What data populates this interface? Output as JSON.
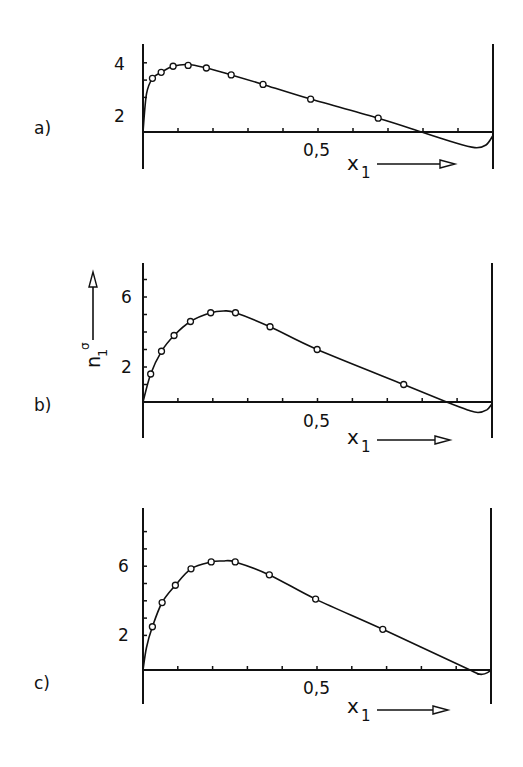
{
  "chart_data": [
    {
      "panel": "a)",
      "type": "line",
      "xlabel": "x1",
      "ylabel": "n1^σ",
      "x_tick_label": "0,5",
      "y_tick_labels": [
        "2",
        "4"
      ],
      "xlim": [
        0,
        1
      ],
      "ylim": [
        -1.5,
        5
      ],
      "x_minor_ticks": [
        0.1,
        0.2,
        0.3,
        0.4,
        0.5,
        0.6,
        0.7,
        0.8,
        0.9
      ],
      "y_minor_ticks": [
        2,
        3,
        4
      ],
      "grid": false,
      "points": {
        "x": [
          0.027,
          0.052,
          0.086,
          0.129,
          0.181,
          0.252,
          0.343,
          0.479,
          0.672
        ],
        "y": [
          3.1,
          3.45,
          3.8,
          3.85,
          3.7,
          3.3,
          2.75,
          1.9,
          0.8
        ]
      },
      "curve": {
        "x": [
          0,
          0.01,
          0.027,
          0.052,
          0.086,
          0.129,
          0.181,
          0.252,
          0.343,
          0.479,
          0.672,
          0.796,
          0.88,
          0.948,
          0.98,
          1.0
        ],
        "y": [
          0,
          2.2,
          3.1,
          3.45,
          3.8,
          3.9,
          3.7,
          3.3,
          2.75,
          1.9,
          0.8,
          0.0,
          -0.55,
          -0.9,
          -0.75,
          -0.2
        ]
      }
    },
    {
      "panel": "b)",
      "type": "line",
      "xlabel": "x1",
      "ylabel": "n1^σ",
      "x_tick_label": "0,5",
      "y_tick_labels": [
        "2",
        "6"
      ],
      "xlim": [
        0,
        1
      ],
      "ylim": [
        -2,
        8
      ],
      "x_minor_ticks": [
        0.1,
        0.2,
        0.3,
        0.4,
        0.5,
        0.6,
        0.7,
        0.8,
        0.9
      ],
      "y_minor_ticks": [
        1,
        2,
        3,
        4,
        5,
        6,
        7
      ],
      "grid": false,
      "points": {
        "x": [
          0.022,
          0.053,
          0.089,
          0.136,
          0.194,
          0.265,
          0.364,
          0.499,
          0.747
        ],
        "y": [
          1.6,
          2.9,
          3.8,
          4.6,
          5.1,
          5.1,
          4.3,
          3.0,
          1.0
        ]
      },
      "curve": {
        "x": [
          0,
          0.022,
          0.053,
          0.089,
          0.136,
          0.194,
          0.23,
          0.265,
          0.364,
          0.499,
          0.747,
          0.87,
          0.93,
          0.96,
          0.985,
          1.0
        ],
        "y": [
          0,
          1.6,
          2.9,
          3.8,
          4.6,
          5.1,
          5.2,
          5.1,
          4.3,
          3.0,
          1.0,
          0.0,
          -0.45,
          -0.6,
          -0.45,
          -0.1
        ]
      }
    },
    {
      "panel": "c)",
      "type": "line",
      "xlabel": "x1",
      "ylabel": "n1^σ",
      "x_tick_label": "0,5",
      "y_tick_labels": [
        "2",
        "6"
      ],
      "xlim": [
        0,
        1
      ],
      "ylim": [
        -2,
        9
      ],
      "x_minor_ticks": [
        0.1,
        0.2,
        0.3,
        0.4,
        0.5,
        0.6,
        0.7,
        0.8,
        0.9
      ],
      "y_minor_ticks": [
        2,
        3,
        4,
        5,
        6,
        7,
        8
      ],
      "grid": false,
      "points": {
        "x": [
          0.027,
          0.055,
          0.093,
          0.138,
          0.196,
          0.265,
          0.363,
          0.496,
          0.689
        ],
        "y": [
          2.5,
          3.9,
          4.9,
          5.85,
          6.25,
          6.25,
          5.5,
          4.1,
          2.35
        ]
      },
      "curve": {
        "x": [
          0,
          0.01,
          0.027,
          0.055,
          0.093,
          0.138,
          0.196,
          0.23,
          0.265,
          0.363,
          0.496,
          0.689,
          0.94,
          0.96,
          0.975,
          0.99,
          1.0
        ],
        "y": [
          0,
          1.3,
          2.5,
          3.9,
          4.9,
          5.85,
          6.25,
          6.3,
          6.25,
          5.5,
          4.1,
          2.35,
          0.0,
          -0.2,
          -0.25,
          -0.15,
          0.0
        ]
      }
    }
  ],
  "labels": {
    "y_axis_label": "n",
    "y_axis_sub": "1",
    "y_axis_sup": "σ",
    "x_axis_label": "x",
    "x_axis_sub": "1",
    "half_tick": "0,5",
    "panel_a": "a)",
    "panel_b": "b)",
    "panel_c": "c)",
    "a_y_top": "4",
    "a_y_low": "2",
    "b_y_top": "6",
    "b_y_low": "2",
    "c_y_top": "6",
    "c_y_low": "2"
  }
}
